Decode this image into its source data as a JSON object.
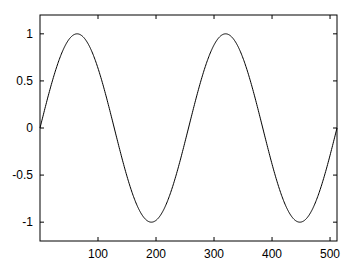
{
  "chart_data": {
    "type": "line",
    "title": "",
    "xlabel": "",
    "ylabel": "",
    "xlim": [
      0,
      512
    ],
    "ylim": [
      -1.2,
      1.2
    ],
    "grid": false,
    "legend": null,
    "xticks": [
      100,
      200,
      300,
      400,
      500
    ],
    "xtick_labels": [
      "100",
      "200",
      "300",
      "400",
      "500"
    ],
    "yticks": [
      1,
      0.5,
      0,
      -0.5,
      -1
    ],
    "ytick_labels": [
      "1",
      "0.5",
      "0",
      "-0.5",
      "-1"
    ],
    "series": [
      {
        "name": "sin(2*pi*x/256)",
        "function": "sin",
        "amplitude": 1,
        "period": 256,
        "x_start": 0,
        "x_end": 512,
        "color": "#000000"
      }
    ]
  }
}
